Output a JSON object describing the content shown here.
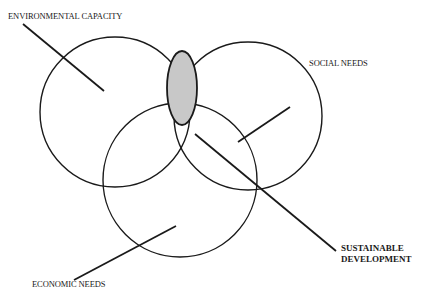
{
  "diagram": {
    "type": "venn",
    "labels": {
      "environmental": "ENVIRONMENTAL CAPACITY",
      "social": "SOCIAL NEEDS",
      "economic": "ECONOMIC NEEDS",
      "sustainable_line1": "SUSTAINABLE",
      "sustainable_line2": "DEVELOPMENT"
    },
    "colors": {
      "stroke": "#1a1a1a",
      "intersection_fill": "#c8c8c8",
      "background": "#ffffff"
    }
  }
}
